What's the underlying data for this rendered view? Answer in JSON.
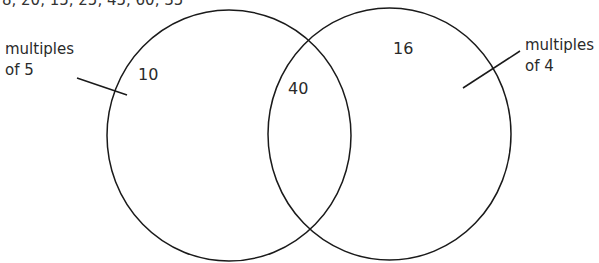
{
  "top_list": "8, 20, 15, 25, 45, 60, 35",
  "venn": {
    "left_set": {
      "label_line1": "multiples",
      "label_line2": "of 5"
    },
    "right_set": {
      "label_line1": "multiples",
      "label_line2": "of 4"
    },
    "regions": {
      "left_only": "10",
      "intersection": "40",
      "right_only": "16"
    }
  },
  "colors": {
    "stroke": "#1a1a1a",
    "text": "#2a2a2a",
    "background": "#ffffff"
  }
}
